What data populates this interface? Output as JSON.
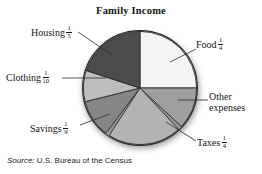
{
  "chart_data": {
    "type": "pie",
    "title": "Family Income",
    "source": "Source: U.S. Bureau of the Census",
    "source_prefix": "Source:",
    "source_body": " U.S. Bureau of the Census",
    "xlabel": "",
    "ylabel": "",
    "legend_position": "none",
    "grid": false,
    "labels": [
      "Food",
      "Other expenses",
      "Taxes",
      "Savings",
      "Clothing",
      "Housing"
    ],
    "values": [
      0.25,
      0.1111,
      0.25,
      0.1111,
      0.1,
      0.2
    ],
    "fraction_labels": [
      "1/4",
      "",
      "1/4",
      "1/9",
      "1/10",
      "1/5"
    ],
    "slices": [
      {
        "name": "Food",
        "fraction_text": "1/4",
        "numerator": "1",
        "denominator": "4",
        "value": 0.25,
        "start_angle": 0,
        "end_angle": 90,
        "color": "#f4f4f2"
      },
      {
        "name": "Other expenses",
        "fraction_text": "",
        "numerator": "",
        "denominator": "",
        "value": 0.1111,
        "start_angle": 90,
        "end_angle": 133,
        "color": "#9e9e9c"
      },
      {
        "name": "Taxes",
        "fraction_text": "1/4",
        "numerator": "1",
        "denominator": "4",
        "value": 0.25,
        "start_angle": 137,
        "end_angle": 213,
        "color": "#b3b3b1"
      },
      {
        "name": "Savings",
        "fraction_text": "1/9",
        "numerator": "1",
        "denominator": "9",
        "value": 0.1111,
        "start_angle": 217,
        "end_angle": 256,
        "color": "#868684"
      },
      {
        "name": "Clothing",
        "fraction_text": "1/10",
        "numerator": "1",
        "denominator": "10",
        "value": 0.1,
        "start_angle": 256,
        "end_angle": 288,
        "color": "#bdbdbb"
      },
      {
        "name": "Housing",
        "fraction_text": "1/5",
        "numerator": "1",
        "denominator": "5",
        "value": 0.2,
        "start_angle": 288,
        "end_angle": 360,
        "color": "#4c4c4a"
      }
    ],
    "colors": {
      "food": "#f4f4f2",
      "other_expenses": "#9e9e9c",
      "taxes": "#b3b3b1",
      "savings": "#868684",
      "clothing": "#bdbdbb",
      "housing": "#4c4c4a",
      "outline": "#2b2b2b",
      "shadow": "#6e6e6e",
      "text": "#141414",
      "background": "#ffffff"
    }
  },
  "labels": {
    "housing": {
      "name": "Housing",
      "num": "1",
      "den": "5"
    },
    "food": {
      "name": "Food",
      "num": "1",
      "den": "4"
    },
    "clothing": {
      "name": "Clothing",
      "num": "1",
      "den": "10"
    },
    "other": {
      "line1": "Other",
      "line2": "expenses"
    },
    "savings": {
      "name": "Savings",
      "num": "1",
      "den": "9"
    },
    "taxes": {
      "name": "Taxes",
      "num": "1",
      "den": "4"
    }
  }
}
